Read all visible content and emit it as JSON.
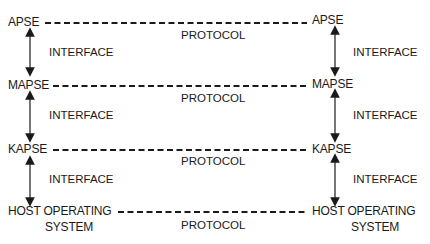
{
  "diagram": {
    "layers": [
      {
        "left_label": "APSE",
        "right_label": "APSE",
        "protocol_label": "PROTOCOL"
      },
      {
        "left_label": "MAPSE",
        "right_label": "MAPSE",
        "protocol_label": "PROTOCOL"
      },
      {
        "left_label": "KAPSE",
        "right_label": "KAPSE",
        "protocol_label": "PROTOCOL"
      },
      {
        "left_label": "HOST OPERATING",
        "left_label_line2": "SYSTEM",
        "right_label": "HOST OPERATING",
        "right_label_line2": "SYSTEM",
        "protocol_label": "PROTOCOL"
      }
    ],
    "interfaces": [
      {
        "left": "INTERFACE",
        "right": "INTERFACE"
      },
      {
        "left": "INTERFACE",
        "right": "INTERFACE"
      },
      {
        "left": "INTERFACE",
        "right": "INTERFACE"
      }
    ],
    "colors": {
      "line": "#1a1a1a",
      "text": "#1a1a1a",
      "background": "#ffffff"
    }
  }
}
